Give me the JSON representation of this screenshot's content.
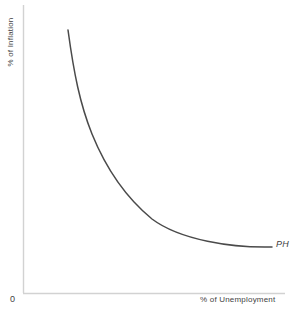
{
  "chart_data": {
    "type": "line",
    "title": "",
    "subtitle": "",
    "xlabel": "% of Unemployment",
    "ylabel": "% of Inflation",
    "origin_label": "0",
    "grid": false,
    "legend_position": "inline-end-of-curve",
    "axis_ranges": {
      "x": [
        0,
        100
      ],
      "y": [
        0,
        100
      ]
    },
    "xticks": [],
    "yticks": [],
    "series": [
      {
        "name": "PH",
        "label": "PH",
        "annotation": "PH",
        "color": "#4a4a4a",
        "x": [
          17,
          21,
          27,
          34,
          42,
          51,
          60,
          70,
          80,
          90,
          95
        ],
        "y": [
          100,
          74,
          54,
          42,
          33,
          27,
          22,
          18,
          15,
          13,
          12
        ]
      }
    ],
    "annotations": [
      {
        "text": "PH",
        "x": 96,
        "y": 13,
        "style": "italic"
      }
    ]
  },
  "axes": {
    "y_label": "% of Inflation",
    "x_label": "% of Unemployment",
    "origin": "0",
    "axis_color": "#d2d2d2"
  },
  "curve": {
    "label": "PH",
    "color": "#4a4a4a",
    "path": "M 68,30 C 74,74 80,104 92,134 C 105,166 124,196 152,219 C 180,240 232,248 272,247"
  },
  "colors": {
    "background": "#ffffff",
    "curve": "#4a4a4a",
    "axis": "#d2d2d2",
    "text": "#3f3f3f"
  }
}
